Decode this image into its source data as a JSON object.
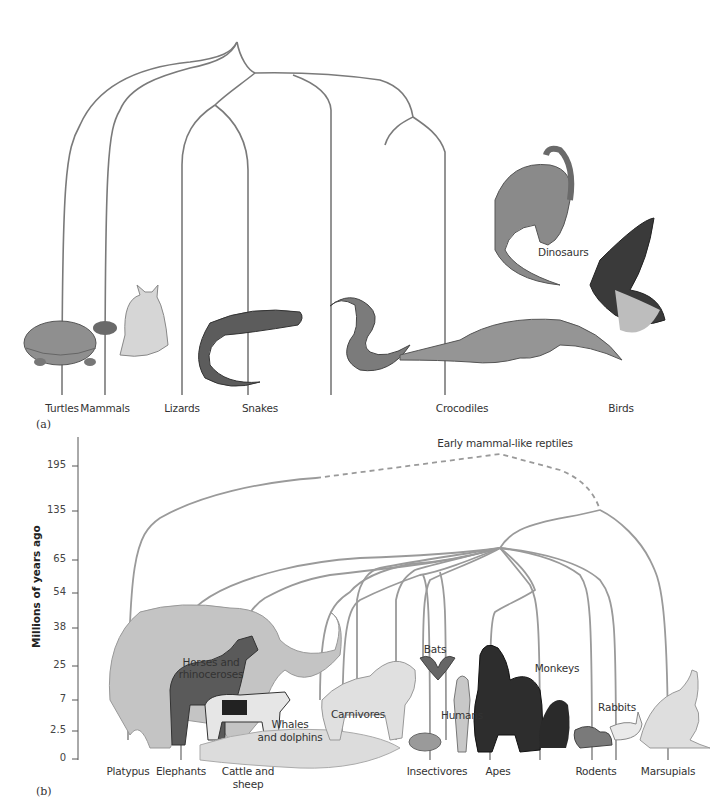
{
  "panel_a": {
    "label": "(a)",
    "title": "Reptile phylogeny",
    "taxa": [
      "Turtles",
      "Mammals",
      "Lizards",
      "Snakes",
      "Crocodiles",
      "Birds"
    ],
    "inner_labels": {
      "dinosaurs": "Dinosaurs"
    },
    "animals": [
      "turtle",
      "cat",
      "lizard",
      "cobra",
      "crocodile",
      "dinosaur",
      "hawk"
    ]
  },
  "panel_b": {
    "label": "(b)",
    "root_label": "Early mammal-like reptiles",
    "y_axis": {
      "title": "Millions of years ago",
      "ticks": [
        "195",
        "135",
        "65",
        "54",
        "38",
        "25",
        "7",
        "2.5",
        "0"
      ]
    },
    "bottom_taxa": [
      "Platypus",
      "Elephants",
      "Cattle and",
      "sheep",
      "Insectivores",
      "Apes",
      "Rodents",
      "Marsupials"
    ],
    "inner_labels": {
      "horses_1": "Horses and",
      "horses_2": "rhinoceroses",
      "whales_1": "Whales",
      "whales_2": "and dolphins",
      "carnivores": "Carnivores",
      "bats": "Bats",
      "humans": "Humans",
      "monkeys": "Monkeys",
      "rabbits": "Rabbits"
    },
    "animals": [
      "platypus",
      "elephant",
      "horse",
      "cow",
      "whale",
      "lion",
      "armadillo",
      "bat",
      "human",
      "gorilla",
      "monkey",
      "squirrel",
      "rabbit",
      "kangaroo"
    ]
  },
  "colors": {
    "branch": "#7a7a7a",
    "branch_b": "#9a9a9a",
    "animal_fill": "#a8a8a8",
    "animal_dark": "#4a4a4a"
  }
}
